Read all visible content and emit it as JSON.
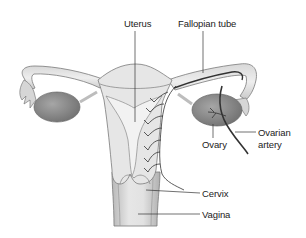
{
  "diagram": {
    "type": "anatomical-illustration",
    "labels": [
      {
        "id": "uterus",
        "text": "Uterus"
      },
      {
        "id": "fallopian_tube",
        "text": "Fallopian tube"
      },
      {
        "id": "ovary",
        "text": "Ovary"
      },
      {
        "id": "ovarian_artery",
        "text": "Ovarian\nartery"
      },
      {
        "id": "cervix",
        "text": "Cervix"
      },
      {
        "id": "vagina",
        "text": "Vagina"
      }
    ],
    "colors": {
      "tissue_light": "#e4e4e4",
      "tissue_mid": "#cfcfcf",
      "ovary": "#8c8c8c",
      "outline": "#6a6a6a",
      "artery": "#3a3a3a",
      "leader_line": "#333333",
      "background": "#ffffff"
    }
  }
}
